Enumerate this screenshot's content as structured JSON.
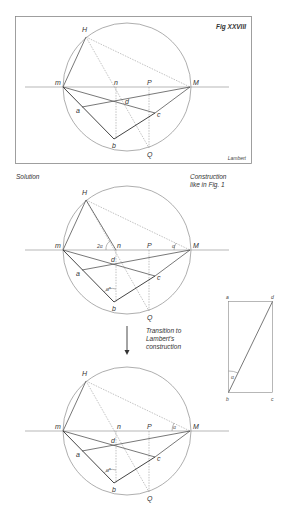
{
  "figure1": {
    "title": "Fig XXVIII",
    "credit": "Lambert",
    "labels": {
      "H": "H",
      "m": "m",
      "n": "n",
      "P": "P",
      "M": "M",
      "d": "d",
      "a": "a",
      "c": "c",
      "b": "b",
      "Q": "Q"
    }
  },
  "figure2": {
    "caption_left": "Solution",
    "caption_right_1": "Construction",
    "caption_right_2": "like in Fig. 1",
    "labels": {
      "H": "H",
      "m": "m",
      "n": "n",
      "P": "P",
      "M": "M",
      "d": "d",
      "a": "a",
      "c": "c",
      "b": "b",
      "Q": "Q",
      "angle_2a": "2α",
      "angle_a": "α",
      "angle_astar": "α*"
    }
  },
  "transition": {
    "line1": "Transition to",
    "line2": "Lambert's",
    "line3": "construction"
  },
  "rectangle": {
    "labels": {
      "a": "a",
      "d": "d",
      "b": "b",
      "c": "c",
      "angle": "α"
    }
  },
  "figure3": {
    "labels": {
      "H": "H",
      "m": "m",
      "n": "n",
      "P": "P",
      "M": "M",
      "d": "d",
      "a": "a",
      "c": "c",
      "b": "b",
      "Q": "Q",
      "angle_a": "α",
      "angle_astar": "α*"
    }
  }
}
